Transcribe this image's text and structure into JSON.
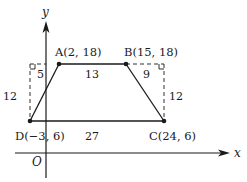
{
  "figure": {
    "type": "coordinate-geometry-trapezoid",
    "axes": {
      "x_label": "x",
      "y_label": "y",
      "origin_label": "O"
    },
    "points": [
      {
        "name": "A",
        "label": "A(2, 18)",
        "x": 2,
        "y": 18
      },
      {
        "name": "B",
        "label": "B(15, 18)",
        "x": 15,
        "y": 18
      },
      {
        "name": "C",
        "label": "C(24, 6)",
        "x": 24,
        "y": 6
      },
      {
        "name": "D",
        "label": "D(−3, 6)",
        "x": -3,
        "y": 6
      }
    ],
    "measurements": {
      "top_side_AB": "13",
      "bottom_side_DC": "27",
      "left_offset": "5",
      "right_offset": "9",
      "left_height": "12",
      "right_height": "12"
    },
    "colors": {
      "line": "#1a1a1a",
      "background": "#ffffff"
    }
  }
}
